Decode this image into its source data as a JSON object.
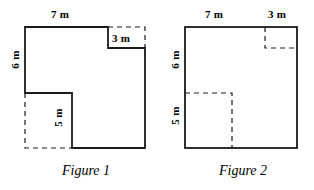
{
  "figures": [
    {
      "caption": "Figure 1",
      "labels": {
        "top": "7 m",
        "left": "6 m",
        "notch_top_right": "3 m",
        "inner_bottom": "5 m"
      }
    },
    {
      "caption": "Figure 2",
      "labels": {
        "top_left": "7 m",
        "top_right": "3 m",
        "left_upper": "6 m",
        "left_lower": "5 m"
      }
    }
  ],
  "style": {
    "stroke_color": "#1a1a1a",
    "background": "#ffffff"
  }
}
